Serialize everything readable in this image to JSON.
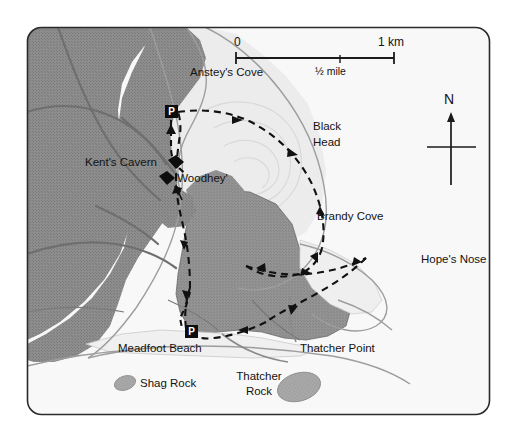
{
  "map": {
    "title": "Torquay coast walking map",
    "frame": {
      "corner_radius": 14
    },
    "scale_bar": {
      "zero_label": "0",
      "km_label": "1 km",
      "mile_label": "1/2 mile",
      "mile_label_display": "½ mile"
    },
    "compass": {
      "north_label": "N"
    },
    "colors": {
      "sea": "#f7f7f7",
      "builtup": "#8b8b8b",
      "headland": "#8f8f8f",
      "cliff": "#ededed",
      "beach": "#f2f2f2",
      "rock": "#a9a9a9",
      "frame_stroke": "#2a2a2a",
      "road": "#6e6e6e",
      "coast": "#9a9a9a",
      "trail": "#111111",
      "label": "#131313"
    },
    "labels": [
      {
        "id": "ansteys-cove",
        "text": "Anstey's Cove",
        "x": 190,
        "y": 73,
        "class": "lbl-place"
      },
      {
        "id": "black-head",
        "text": "Black",
        "x": 313,
        "y": 126,
        "class": "lbl-place"
      },
      {
        "id": "black-head-2",
        "text": "Head",
        "x": 313,
        "y": 141,
        "class": "lbl-place"
      },
      {
        "id": "kents-cavern",
        "text": "Kent's Cavern",
        "x": 85,
        "y": 162,
        "class": "lbl-place"
      },
      {
        "id": "woodhey",
        "text": "'Woodhey'",
        "x": 171,
        "y": 178,
        "class": "lbl-place"
      },
      {
        "id": "brandy-cove",
        "text": "Brandy Cove",
        "x": 317,
        "y": 216,
        "class": "lbl-place"
      },
      {
        "id": "hopes-nose",
        "text": "Hope's Nose",
        "x": 421,
        "y": 259,
        "class": "lbl-place"
      },
      {
        "id": "meadfoot-beach",
        "text": "Meadfoot Beach",
        "x": 118,
        "y": 348,
        "class": "lbl-place"
      },
      {
        "id": "thatcher-point",
        "text": "Thatcher Point",
        "x": 300,
        "y": 348,
        "class": "lbl-place"
      },
      {
        "id": "shag-rock",
        "text": "Shag Rock",
        "x": 136,
        "y": 383,
        "class": "lbl-place"
      },
      {
        "id": "thatcher-rock",
        "text": "Thatcher",
        "x": 235,
        "y": 375,
        "class": "lbl-place"
      },
      {
        "id": "thatcher-rock-2",
        "text": "Rock",
        "x": 246,
        "y": 390,
        "class": "lbl-place"
      }
    ],
    "parking_markers": [
      {
        "id": "parking-north",
        "label": "P",
        "x": 165,
        "y": 105
      },
      {
        "id": "parking-south",
        "label": "P",
        "x": 185,
        "y": 325
      }
    ],
    "site_markers": [
      {
        "id": "kents-cavern-marker",
        "name": "Kent's Cavern"
      },
      {
        "id": "woodhey-marker",
        "name": "'Woodhey'"
      }
    ],
    "features": {
      "rocks": [
        "Shag Rock",
        "Thatcher Rock"
      ],
      "coves": [
        "Anstey's Cove",
        "Brandy Cove"
      ],
      "headlands": [
        "Black Head",
        "Hope's Nose",
        "Thatcher Point"
      ],
      "beaches": [
        "Meadfoot Beach"
      ],
      "trail_type": "dashed footpath with direction arrows"
    }
  }
}
